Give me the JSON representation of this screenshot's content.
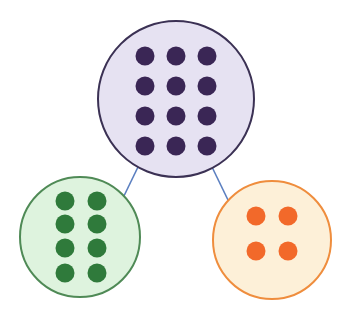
{
  "diagram": {
    "type": "tree",
    "connector_color": "#5b7fc0",
    "nodes": [
      {
        "id": "parent",
        "count": 12,
        "rows": 4,
        "cols": 3,
        "fill": "#e6e2f2",
        "stroke": "#3b3154",
        "dot_color": "#3a2655",
        "cx": 176,
        "cy": 99,
        "r": 78
      },
      {
        "id": "left-child",
        "count": 8,
        "rows": 4,
        "cols": 2,
        "fill": "#def3de",
        "stroke": "#4f8a56",
        "dot_color": "#2f7a3b",
        "cx": 80,
        "cy": 237,
        "r": 60
      },
      {
        "id": "right-child",
        "count": 4,
        "rows": 2,
        "cols": 2,
        "fill": "#fdf0d8",
        "stroke": "#ef8d3d",
        "dot_color": "#f2692a",
        "cx": 272,
        "cy": 240,
        "r": 59
      }
    ],
    "edges": [
      {
        "from": "parent",
        "to": "left-child"
      },
      {
        "from": "parent",
        "to": "right-child"
      }
    ]
  }
}
